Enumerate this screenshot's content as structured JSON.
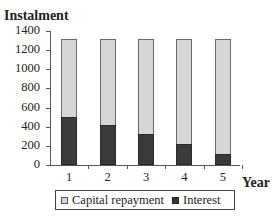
{
  "chart_data": {
    "type": "bar",
    "stacked": true,
    "title": "",
    "xlabel": "Year",
    "ylabel": "Instalment",
    "categories": [
      "1",
      "2",
      "3",
      "4",
      "5"
    ],
    "series": [
      {
        "name": "Interest",
        "color": "#3a3a3a",
        "values": [
          500,
          420,
          325,
          220,
          115
        ]
      },
      {
        "name": "Capital repayment",
        "color": "#d6d6d6",
        "values": [
          820,
          900,
          995,
          1100,
          1205
        ]
      }
    ],
    "totals": [
      1320,
      1320,
      1320,
      1320,
      1320
    ],
    "ylim": [
      0,
      1400
    ],
    "yticks": [
      "0",
      "200",
      "400",
      "600",
      "800",
      "1000",
      "1200",
      "1400"
    ],
    "grid": false,
    "legend_position": "bottom"
  },
  "legend": {
    "items": [
      {
        "label": "Capital repayment",
        "color": "#d6d6d6"
      },
      {
        "label": "Interest",
        "color": "#3a3a3a"
      }
    ]
  }
}
